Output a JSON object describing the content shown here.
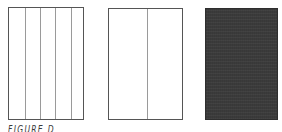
{
  "figure": {
    "caption": "FIGURE D",
    "panels": [
      {
        "id": "panel-five-columns",
        "columns": 5,
        "fill": "#ffffff",
        "stroke": "#555555"
      },
      {
        "id": "panel-two-columns",
        "columns": 2,
        "fill": "#ffffff",
        "stroke": "#555555"
      },
      {
        "id": "panel-solid-dark",
        "columns": 1,
        "fill": "#3b3b3b",
        "stroke": "#2e2e2e"
      }
    ]
  }
}
